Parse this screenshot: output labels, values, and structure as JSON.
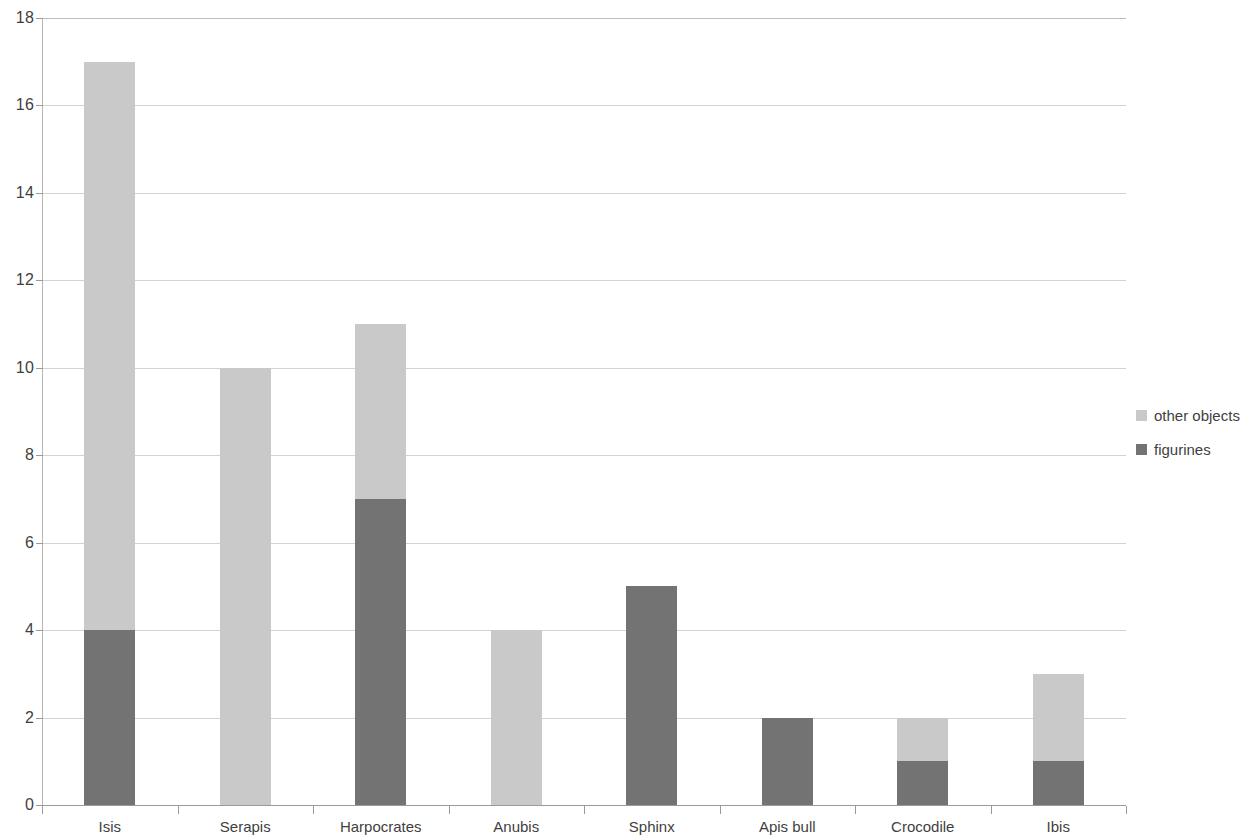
{
  "chart_data": {
    "type": "bar",
    "stacked": true,
    "title": "",
    "subtitle": "",
    "xlabel": "",
    "ylabel": "",
    "categories": [
      "Isis",
      "Serapis",
      "Harpocrates",
      "Anubis",
      "Sphinx",
      "Apis bull",
      "Crocodile",
      "Ibis"
    ],
    "series": [
      {
        "name": "figurines",
        "color": "#737373",
        "values": [
          4,
          0,
          7,
          0,
          5,
          2,
          1,
          1
        ]
      },
      {
        "name": "other objects",
        "color": "#c9c9c9",
        "values": [
          13,
          10,
          4,
          4,
          0,
          0,
          1,
          2
        ]
      }
    ],
    "totals": [
      17,
      10,
      11,
      4,
      5,
      2,
      2,
      3
    ],
    "ylim": [
      0,
      18
    ],
    "ytick_labels": [
      "0",
      "2",
      "4",
      "6",
      "8",
      "10",
      "12",
      "14",
      "16",
      "18"
    ],
    "ytick_values": [
      0,
      2,
      4,
      6,
      8,
      10,
      12,
      14,
      16,
      18
    ],
    "grid": "horizontal",
    "legend_position": "right",
    "legend_order": [
      "other objects",
      "figurines"
    ]
  },
  "legend": {
    "items": [
      {
        "label": "other objects",
        "color": "#c9c9c9"
      },
      {
        "label": "figurines",
        "color": "#737373"
      }
    ]
  },
  "colors": {
    "other_objects": "#c9c9c9",
    "figurines": "#737373",
    "gridline": "#d3d3d3",
    "axis": "#9a9a9a",
    "text": "#3f3f3f",
    "background": "#ffffff"
  }
}
